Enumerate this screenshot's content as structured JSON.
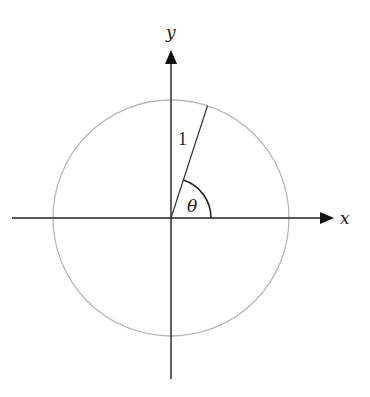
{
  "diagram": {
    "axes": {
      "x_label": "x",
      "y_label": "y"
    },
    "radius_label": "1",
    "angle_label": "θ",
    "geometry": {
      "center": [
        171,
        218
      ],
      "circle_radius": 118,
      "angle_degrees": 72,
      "arc_radius": 40
    },
    "colors": {
      "axis": "#222222",
      "circle": "#b8b8b8",
      "radius_line": "#333333",
      "arc": "#222222"
    }
  }
}
